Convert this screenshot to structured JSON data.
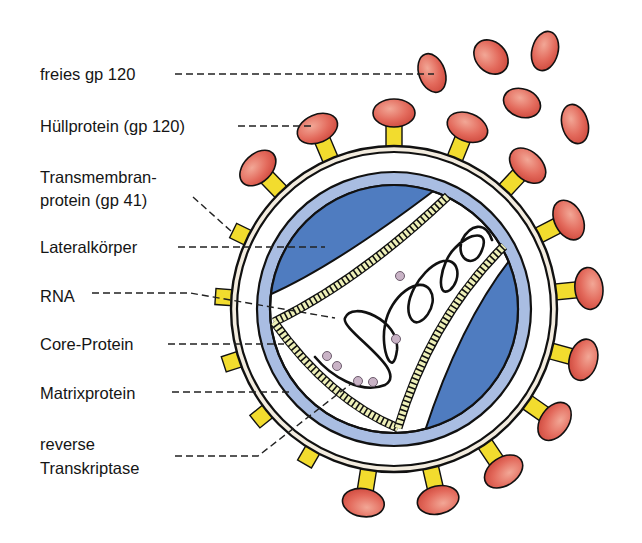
{
  "figure": {
    "colors": {
      "gp120_cap": "#e0665a",
      "gp41_stem": "#f2dc2e",
      "envelope_ring": "#f3ecdf",
      "matrix_band": "#a9bde2",
      "lateral_body": "#4f7cc0",
      "core_wall": "#eef0b8",
      "rt_particle": "#c9b3c6",
      "outline": "#111111"
    }
  },
  "labels": [
    {
      "id": "freies-gp120",
      "text": "freies gp 120"
    },
    {
      "id": "huellprotein",
      "text": "Hüllprotein (gp 120)"
    },
    {
      "id": "transmembran-line1",
      "text": "Transmembran-"
    },
    {
      "id": "transmembran-line2",
      "text": "protein (gp 41)"
    },
    {
      "id": "lateralkoerper",
      "text": "Lateralkörper"
    },
    {
      "id": "rna",
      "text": "RNA"
    },
    {
      "id": "core-protein",
      "text": "Core-Protein"
    },
    {
      "id": "matrixprotein",
      "text": "Matrixprotein"
    },
    {
      "id": "reverse-line1",
      "text": "reverse"
    },
    {
      "id": "reverse-line2",
      "text": "Transkriptase"
    }
  ]
}
